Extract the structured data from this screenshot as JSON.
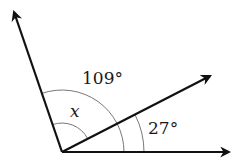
{
  "diagram": {
    "type": "angle-diagram",
    "vertex": [
      62,
      152
    ],
    "rays": [
      {
        "name": "upper-ray",
        "angle_deg": 109,
        "tip": [
          13,
          10
        ]
      },
      {
        "name": "middle-ray",
        "angle_deg": 27,
        "tip": [
          212,
          75
        ]
      },
      {
        "name": "horizontal-ray",
        "angle_deg": 0,
        "tip": [
          231,
          152
        ]
      }
    ],
    "arcs": [
      {
        "name": "arc-109",
        "radius": 62,
        "from_deg": 0,
        "to_deg": 109
      },
      {
        "name": "arc-27",
        "radius": 82,
        "from_deg": 0,
        "to_deg": 27
      },
      {
        "name": "arc-x",
        "radius": 29,
        "from_deg": 27,
        "to_deg": 109
      }
    ],
    "labels": {
      "angle_total": "109°",
      "angle_small": "27°",
      "unknown": "x"
    },
    "colors": {
      "line": "#111111",
      "arc": "#777777"
    }
  }
}
